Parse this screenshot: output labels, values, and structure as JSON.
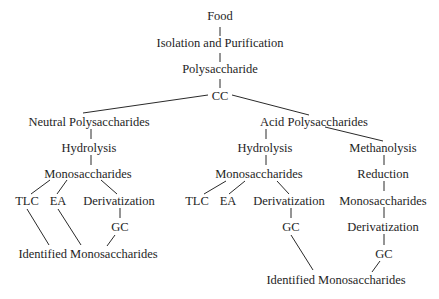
{
  "diagram": {
    "type": "flowchart-tree",
    "nodes": {
      "food": "Food",
      "isolation": "Isolation and Purification",
      "polysaccharide": "Polysaccharide",
      "cc": "CC",
      "neutral": "Neutral Polysaccharides",
      "neutral_hydrolysis": "Hydrolysis",
      "neutral_mono": "Monosaccharides",
      "neutral_tlc": "TLC",
      "neutral_ea": "EA",
      "neutral_deriv": "Derivatization",
      "neutral_gc": "GC",
      "neutral_identified": "Identified Monosaccharides",
      "acid": "Acid Polysaccharides",
      "acid_hydrolysis": "Hydrolysis",
      "acid_mono": "Monosaccharides",
      "acid_tlc": "TLC",
      "acid_ea": "EA",
      "acid_deriv": "Derivatization",
      "acid_gc": "GC",
      "methanolysis": "Methanolysis",
      "reduction": "Reduction",
      "meth_mono": "Monosaccharides",
      "meth_deriv": "Derivatization",
      "meth_gc": "GC",
      "acid_identified": "Identified Monosaccharides"
    },
    "edges": [
      [
        "Food",
        "Isolation and Purification"
      ],
      [
        "Isolation and Purification",
        "Polysaccharide"
      ],
      [
        "Polysaccharide",
        "CC"
      ],
      [
        "CC",
        "Neutral Polysaccharides"
      ],
      [
        "CC",
        "Acid Polysaccharides"
      ],
      [
        "Neutral Polysaccharides",
        "Hydrolysis"
      ],
      [
        "Hydrolysis",
        "Monosaccharides"
      ],
      [
        "Monosaccharides",
        "TLC"
      ],
      [
        "Monosaccharides",
        "EA"
      ],
      [
        "Monosaccharides",
        "Derivatization"
      ],
      [
        "Derivatization",
        "GC"
      ],
      [
        "TLC",
        "Identified Monosaccharides"
      ],
      [
        "EA",
        "Identified Monosaccharides"
      ],
      [
        "GC",
        "Identified Monosaccharides"
      ],
      [
        "Acid Polysaccharides",
        "Hydrolysis"
      ],
      [
        "Acid Polysaccharides",
        "Methanolysis"
      ],
      [
        "Hydrolysis",
        "Monosaccharides"
      ],
      [
        "Monosaccharides",
        "TLC"
      ],
      [
        "Monosaccharides",
        "EA"
      ],
      [
        "Monosaccharides",
        "Derivatization"
      ],
      [
        "Derivatization",
        "GC"
      ],
      [
        "GC",
        "Identified Monosaccharides"
      ],
      [
        "Methanolysis",
        "Reduction"
      ],
      [
        "Reduction",
        "Monosaccharides"
      ],
      [
        "Monosaccharides",
        "Derivatization"
      ],
      [
        "Derivatization",
        "GC"
      ],
      [
        "GC",
        "Identified Monosaccharides"
      ]
    ]
  }
}
